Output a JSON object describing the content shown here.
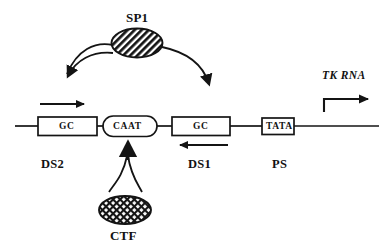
{
  "figure": {
    "background_color": "#ffffff",
    "line_color": "#121212"
  },
  "factors": [
    {
      "id": "sp1",
      "label": "SP1",
      "shape": "ellipse",
      "fill_pattern": "diagonal-hatch",
      "label_position": "above"
    },
    {
      "id": "ctf",
      "label": "CTF",
      "shape": "ellipse",
      "fill_pattern": "cross-hatch-mesh",
      "label_position": "below"
    }
  ],
  "dna_elements": [
    {
      "id": "gc-box-distal",
      "label": "GC",
      "shape": "rectangle"
    },
    {
      "id": "caat-box",
      "label": "CAAT",
      "shape": "rounded-pill"
    },
    {
      "id": "gc-box-proximal",
      "label": "GC",
      "shape": "rectangle"
    },
    {
      "id": "tata-box",
      "label": "TATA",
      "shape": "rectangle"
    }
  ],
  "domain_labels": [
    {
      "id": "ds2",
      "label": "DS2"
    },
    {
      "id": "ds1",
      "label": "DS1"
    },
    {
      "id": "ps",
      "label": "PS"
    }
  ],
  "transcript": {
    "label": "TK  RNA",
    "direction": "rightward",
    "marker": "bent-transcription-start-arrow"
  },
  "arrows": [
    {
      "id": "sp1-to-ds2",
      "style": "curved-double-line",
      "head": "down"
    },
    {
      "id": "sp1-to-ds1",
      "style": "curved-single-line",
      "head": "down"
    },
    {
      "id": "ctf-to-caat",
      "style": "forked-curve",
      "head": "up"
    },
    {
      "id": "ds2-direction-arrow",
      "style": "straight",
      "head": "right"
    },
    {
      "id": "ds1-direction-arrow",
      "style": "straight",
      "head": "left"
    }
  ]
}
